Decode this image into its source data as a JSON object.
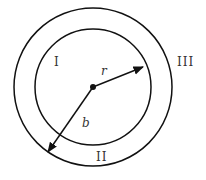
{
  "diagram": {
    "type": "concentric-circles",
    "regions": {
      "inner": "I",
      "shell": "II",
      "outer": "III"
    },
    "vectors": {
      "r_label": "r",
      "b_label": "b"
    },
    "colors": {
      "stroke": "#111111",
      "label": "#333333",
      "background": "#ffffff"
    }
  }
}
